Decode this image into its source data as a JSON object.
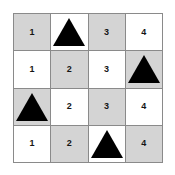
{
  "page": {
    "background_color": "#ffffff"
  },
  "grid": {
    "rows": 4,
    "columns": 4,
    "border_color": "#8a8a8a",
    "shaded_cell_color": "#d4d4d4",
    "plain_cell_color": "#ffffff",
    "triangle_color": "#000000",
    "triangle_icon_name": "triangle-icon",
    "cells": [
      {
        "row": 1,
        "col": 1,
        "shaded": true,
        "content_type": "number",
        "label": "1"
      },
      {
        "row": 1,
        "col": 2,
        "shaded": false,
        "content_type": "triangle",
        "label": ""
      },
      {
        "row": 1,
        "col": 3,
        "shaded": true,
        "content_type": "number",
        "label": "3"
      },
      {
        "row": 1,
        "col": 4,
        "shaded": false,
        "content_type": "number",
        "label": "4"
      },
      {
        "row": 2,
        "col": 1,
        "shaded": false,
        "content_type": "number",
        "label": "1"
      },
      {
        "row": 2,
        "col": 2,
        "shaded": true,
        "content_type": "number",
        "label": "2"
      },
      {
        "row": 2,
        "col": 3,
        "shaded": false,
        "content_type": "number",
        "label": "3"
      },
      {
        "row": 2,
        "col": 4,
        "shaded": true,
        "content_type": "triangle",
        "label": ""
      },
      {
        "row": 3,
        "col": 1,
        "shaded": true,
        "content_type": "triangle",
        "label": ""
      },
      {
        "row": 3,
        "col": 2,
        "shaded": false,
        "content_type": "number",
        "label": "2"
      },
      {
        "row": 3,
        "col": 3,
        "shaded": true,
        "content_type": "number",
        "label": "3"
      },
      {
        "row": 3,
        "col": 4,
        "shaded": false,
        "content_type": "number",
        "label": "4"
      },
      {
        "row": 4,
        "col": 1,
        "shaded": false,
        "content_type": "number",
        "label": "1"
      },
      {
        "row": 4,
        "col": 2,
        "shaded": true,
        "content_type": "number",
        "label": "2"
      },
      {
        "row": 4,
        "col": 3,
        "shaded": false,
        "content_type": "triangle",
        "label": ""
      },
      {
        "row": 4,
        "col": 4,
        "shaded": true,
        "content_type": "number",
        "label": "4"
      }
    ]
  }
}
